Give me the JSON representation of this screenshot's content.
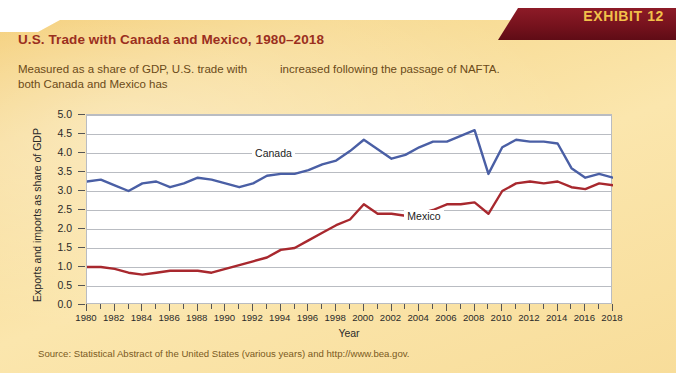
{
  "banner": {
    "label": "EXHIBIT 12"
  },
  "header": {
    "title": "U.S. Trade with Canada and Mexico, 1980–2018",
    "subtitle_col1": "Measured as a share of GDP, U.S. trade with both Canada and Mexico has",
    "subtitle_col2": "increased following the passage of NAFTA."
  },
  "source": {
    "text": "Source: Statistical Abstract of the United States (various years) and http://www.bea.gov."
  },
  "colors": {
    "panel_gold": "#f7d98f",
    "banner_maroon": "#76121d",
    "banner_text": "#f2c14a",
    "title_red": "#9b2f1e",
    "canada_line": "#4a5fa5",
    "mexico_line": "#a8282e",
    "gridline": "#b9bcc2",
    "plot_background": "#ffffff",
    "source_text": "#7a5a1e"
  },
  "chart_data": {
    "type": "line",
    "title": "U.S. Trade with Canada and Mexico, 1980–2018",
    "xlabel": "Year",
    "ylabel": "Exports and imports as share of GDP",
    "xlim": [
      1980,
      2018
    ],
    "ylim": [
      0.0,
      5.0
    ],
    "grid": true,
    "legend": "inline-labels",
    "ytick_labels": [
      "0.0",
      "0.5",
      "1.0",
      "1.5",
      "2.0",
      "2.5",
      "3.0",
      "3.5",
      "4.0",
      "4.5",
      "5.0"
    ],
    "ytick_values": [
      0.0,
      0.5,
      1.0,
      1.5,
      2.0,
      2.5,
      3.0,
      3.5,
      4.0,
      4.5,
      5.0
    ],
    "xtick_labels": [
      "1980",
      "1982",
      "1984",
      "1986",
      "1988",
      "1990",
      "1992",
      "1994",
      "1996",
      "1998",
      "2000",
      "2002",
      "2004",
      "2006",
      "2008",
      "2010",
      "2012",
      "2014",
      "2016",
      "2018"
    ],
    "xtick_values": [
      1980,
      1982,
      1984,
      1986,
      1988,
      1990,
      1992,
      1994,
      1996,
      1998,
      2000,
      2002,
      2004,
      2006,
      2008,
      2010,
      2012,
      2014,
      2016,
      2018
    ],
    "x": [
      1980,
      1981,
      1982,
      1983,
      1984,
      1985,
      1986,
      1987,
      1988,
      1989,
      1990,
      1991,
      1992,
      1993,
      1994,
      1995,
      1996,
      1997,
      1998,
      1999,
      2000,
      2001,
      2002,
      2003,
      2004,
      2005,
      2006,
      2007,
      2008,
      2009,
      2010,
      2011,
      2012,
      2013,
      2014,
      2015,
      2016,
      2017,
      2018
    ],
    "series": [
      {
        "name": "Canada",
        "color": "#4a5fa5",
        "label_x": 1992,
        "label_y": 3.95,
        "values": [
          3.25,
          3.3,
          3.15,
          3.0,
          3.2,
          3.25,
          3.1,
          3.2,
          3.35,
          3.3,
          3.2,
          3.1,
          3.2,
          3.4,
          3.45,
          3.45,
          3.55,
          3.7,
          3.8,
          4.05,
          4.35,
          4.1,
          3.85,
          3.95,
          4.15,
          4.3,
          4.3,
          4.45,
          4.6,
          3.45,
          4.15,
          4.35,
          4.3,
          4.3,
          4.25,
          3.6,
          3.35,
          3.45,
          3.35
        ],
        "units": "percent of GDP"
      },
      {
        "name": "Mexico",
        "color": "#a8282e",
        "label_x": 2003,
        "label_y": 2.3,
        "values": [
          1.0,
          1.0,
          0.95,
          0.85,
          0.8,
          0.85,
          0.9,
          0.9,
          0.9,
          0.85,
          0.95,
          1.05,
          1.15,
          1.25,
          1.45,
          1.5,
          1.7,
          1.9,
          2.1,
          2.25,
          2.65,
          2.4,
          2.4,
          2.35,
          2.4,
          2.5,
          2.65,
          2.65,
          2.7,
          2.4,
          3.0,
          3.2,
          3.25,
          3.2,
          3.25,
          3.1,
          3.05,
          3.2,
          3.15
        ],
        "units": "percent of GDP"
      }
    ]
  }
}
